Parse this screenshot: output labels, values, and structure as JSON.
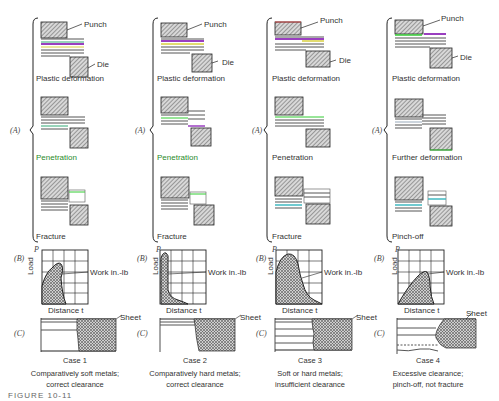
{
  "figure_label": "FIGURE 10-11",
  "row_labels": {
    "A": "(A)",
    "B": "(B)",
    "C": "(C)"
  },
  "callouts": {
    "punch": "Punch",
    "die": "Die",
    "sheet": "Sheet",
    "work": "Work in.-lb"
  },
  "axes": {
    "y": "Load",
    "y_symbol": "P",
    "x": "Distance t"
  },
  "colors": {
    "hatch": "#888888",
    "line": "#222222",
    "accent_green": "#2a8a2a",
    "layer_purple": "#9a3fc0",
    "layer_yellow": "#d8d040",
    "layer_teal": "#40b8c0"
  },
  "cases": [
    {
      "id": 1,
      "stages": [
        "Plastic deformation",
        "Penetration",
        "Fracture"
      ],
      "title": "Case 1",
      "desc_line1": "Comparatively soft metals;",
      "desc_line2": "correct clearance",
      "curve": "broad peak near 30% distance"
    },
    {
      "id": 2,
      "stages": [
        "Plastic deformation",
        "Penetration",
        "Fracture"
      ],
      "title": "Case 2",
      "desc_line1": "Comparatively hard metals;",
      "desc_line2": "correct clearance",
      "curve": "sharp early peak, rapid drop"
    },
    {
      "id": 3,
      "stages": [
        "Plastic deformation",
        "Penetration",
        "Fracture"
      ],
      "title": "Case 3",
      "desc_line1": "Soft or hard metals;",
      "desc_line2": "insufficient clearance",
      "curve": "high broad hump with long tail"
    },
    {
      "id": 4,
      "stages": [
        "Plastic deformation",
        "Further deformation",
        "Pinch-off"
      ],
      "title": "Case 4",
      "desc_line1": "Excessive clearance;",
      "desc_line2": "pinch-off, not fracture",
      "curve": "ramp up, peak at 60% distance"
    }
  ]
}
